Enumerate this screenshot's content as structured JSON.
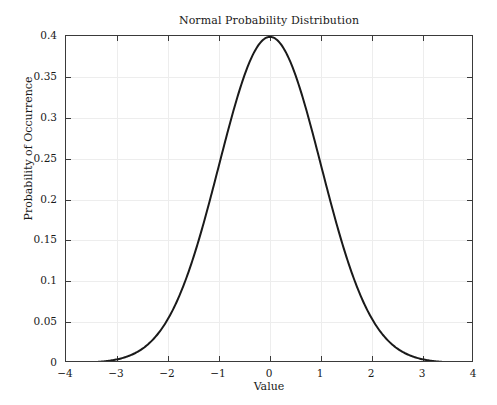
{
  "chart_data": {
    "type": "line",
    "title": "Normal Probability Distribution",
    "xlabel": "Value",
    "ylabel": "Probability of Occurrence",
    "xlim": [
      -4,
      4
    ],
    "ylim": [
      0,
      0.4
    ],
    "grid": true,
    "legend": null,
    "xticks": [
      -4,
      -3,
      -2,
      -1,
      0,
      1,
      2,
      3,
      4
    ],
    "xticklabels": [
      "−4",
      "−3",
      "−2",
      "−1",
      "0",
      "1",
      "2",
      "3",
      "4"
    ],
    "yticks": [
      0,
      0.05,
      0.1,
      0.15,
      0.2,
      0.25,
      0.3,
      0.35,
      0.4
    ],
    "yticklabels": [
      "0",
      "0.05",
      "0.1",
      "0.15",
      "0.2",
      "0.25",
      "0.3",
      "0.35",
      "0.4"
    ],
    "series": [
      {
        "name": "Normal PDF (mean 0, sd 1)",
        "color": "#1a1a1a",
        "linewidth": 2,
        "x": [
          -4,
          -3.8,
          -3.6,
          -3.4,
          -3.2,
          -3,
          -2.8,
          -2.6,
          -2.4,
          -2.2,
          -2,
          -1.8,
          -1.6,
          -1.4,
          -1.2,
          -1,
          -0.8,
          -0.6,
          -0.4,
          -0.2,
          0,
          0.2,
          0.4,
          0.6,
          0.8,
          1,
          1.2,
          1.4,
          1.6,
          1.8,
          2,
          2.2,
          2.4,
          2.6,
          2.8,
          3,
          3.2,
          3.4,
          3.6,
          3.8,
          4
        ],
        "y": [
          0.0001,
          0.0003,
          0.0006,
          0.0012,
          0.0024,
          0.0044,
          0.0079,
          0.0136,
          0.0224,
          0.0355,
          0.054,
          0.079,
          0.1109,
          0.1497,
          0.1942,
          0.242,
          0.2897,
          0.3332,
          0.3683,
          0.391,
          0.3989,
          0.391,
          0.3683,
          0.3332,
          0.2897,
          0.242,
          0.1942,
          0.1497,
          0.1109,
          0.079,
          0.054,
          0.0355,
          0.0224,
          0.0136,
          0.0079,
          0.0044,
          0.0024,
          0.0012,
          0.0006,
          0.0003,
          0.0001
        ]
      }
    ]
  },
  "figure": {
    "background": "#ffffff",
    "axis_color": "#3a3a3a",
    "grid_color": "#ededed"
  }
}
